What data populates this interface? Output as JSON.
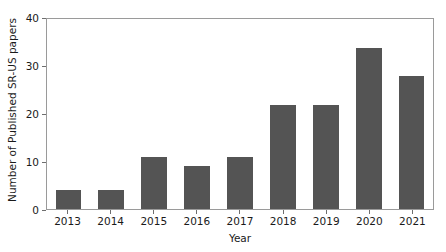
{
  "chart_data": {
    "type": "bar",
    "title": "",
    "xlabel": "Year",
    "ylabel": "Number of Published SR-US papers",
    "categories": [
      "2013",
      "2014",
      "2015",
      "2016",
      "2017",
      "2018",
      "2019",
      "2020",
      "2021"
    ],
    "values": [
      4,
      4,
      11,
      9,
      11,
      22,
      22,
      34,
      28
    ],
    "ylim": [
      0,
      40
    ],
    "yticks": [
      "0",
      "10",
      "20",
      "30",
      "40"
    ],
    "ytick_values": [
      0,
      10,
      20,
      30,
      40
    ],
    "grid": false,
    "legend": null,
    "bar_color": "#545454",
    "frame_color": "#9a9a9a",
    "background": "#ffffff"
  }
}
